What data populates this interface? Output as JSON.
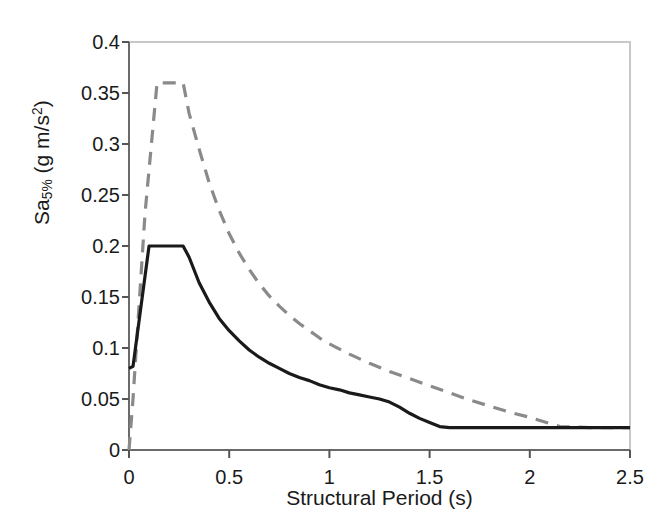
{
  "chart_data": {
    "type": "line",
    "title": "",
    "xlabel": "Structural Period (s)",
    "ylabel_parts": {
      "base": "Sa",
      "subscript": "5%",
      "units_open": " (g m/s",
      "superscript": "2",
      "units_close": ")"
    },
    "ylabel": "Sa5% (g m/s2)",
    "xlim": [
      0,
      2.5
    ],
    "ylim": [
      0,
      0.4
    ],
    "xticks": [
      0,
      0.5,
      1,
      1.5,
      2,
      2.5
    ],
    "xtick_labels": [
      "0",
      "0.5",
      "1",
      "1.5",
      "2",
      "2.5"
    ],
    "yticks": [
      0,
      0.05,
      0.1,
      0.15,
      0.2,
      0.25,
      0.3,
      0.35,
      0.4
    ],
    "ytick_labels": [
      "0",
      "0.05",
      "0.1",
      "0.15",
      "0.2",
      "0.25",
      "0.3",
      "0.35",
      "0.4"
    ],
    "grid": false,
    "legend": null,
    "legend_position": "none",
    "series": [
      {
        "name": "solid-spectrum",
        "style": "solid",
        "color": "#1a1a1a",
        "width": 3.2,
        "x": [
          0.0,
          0.02,
          0.1,
          0.27,
          0.3,
          0.35,
          0.4,
          0.45,
          0.5,
          0.55,
          0.6,
          0.65,
          0.7,
          0.75,
          0.8,
          0.85,
          0.9,
          0.95,
          1.0,
          1.05,
          1.1,
          1.15,
          1.2,
          1.25,
          1.3,
          1.35,
          1.4,
          1.45,
          1.5,
          1.55,
          1.6,
          1.8,
          2.0,
          2.2,
          2.5
        ],
        "y": [
          0.08,
          0.082,
          0.2,
          0.2,
          0.189,
          0.164,
          0.145,
          0.129,
          0.117,
          0.107,
          0.098,
          0.091,
          0.085,
          0.08,
          0.075,
          0.071,
          0.068,
          0.064,
          0.061,
          0.059,
          0.056,
          0.054,
          0.052,
          0.05,
          0.047,
          0.042,
          0.036,
          0.031,
          0.027,
          0.023,
          0.022,
          0.022,
          0.022,
          0.022,
          0.022
        ]
      },
      {
        "name": "dashed-spectrum",
        "style": "dashed",
        "color": "#8a8a8a",
        "width": 3.2,
        "dash": "13,9",
        "x": [
          0.0,
          0.02,
          0.08,
          0.14,
          0.27,
          0.3,
          0.35,
          0.4,
          0.45,
          0.5,
          0.55,
          0.6,
          0.65,
          0.7,
          0.75,
          0.8,
          0.85,
          0.9,
          0.95,
          1.0,
          1.1,
          1.2,
          1.3,
          1.4,
          1.5,
          1.6,
          1.7,
          1.8,
          1.9,
          2.0,
          2.1,
          2.15,
          2.3,
          2.5
        ],
        "y": [
          0.0,
          0.05,
          0.232,
          0.36,
          0.36,
          0.33,
          0.295,
          0.262,
          0.235,
          0.212,
          0.193,
          0.177,
          0.163,
          0.151,
          0.141,
          0.132,
          0.124,
          0.117,
          0.11,
          0.104,
          0.094,
          0.085,
          0.077,
          0.07,
          0.063,
          0.056,
          0.049,
          0.043,
          0.037,
          0.032,
          0.026,
          0.023,
          0.022,
          0.022
        ]
      }
    ]
  },
  "axes": {
    "frame_color": "#c8c8c8",
    "tick_color": "#555555",
    "background": "#ffffff"
  }
}
